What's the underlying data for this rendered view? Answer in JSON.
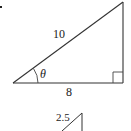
{
  "figure": {
    "main_triangle": {
      "hypotenuse_label": "10",
      "base_label": "8",
      "angle_label": "θ",
      "right_angle_marker": true
    },
    "second_triangle": {
      "hypotenuse_label": "2.5"
    },
    "stray_mark": "."
  }
}
